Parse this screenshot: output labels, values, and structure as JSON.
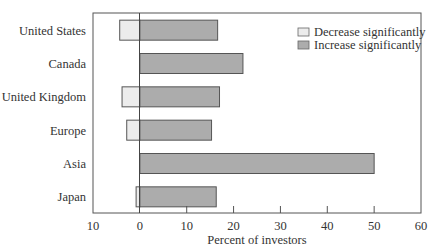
{
  "chart_data": {
    "type": "bar",
    "orientation": "horizontal",
    "stacked": "diverging",
    "title": "",
    "xlabel": "Percent of investors",
    "ylabel": "",
    "xlim": [
      -10,
      60
    ],
    "x_ticks": [
      -10,
      0,
      10,
      20,
      30,
      40,
      50,
      60
    ],
    "x_tick_labels": [
      "10",
      "0",
      "10",
      "20",
      "30",
      "40",
      "50",
      "60"
    ],
    "grid": false,
    "legend_position": "upper right (inside)",
    "categories": [
      "United States",
      "Canada",
      "United Kingdom",
      "Europe",
      "Asia",
      "Japan"
    ],
    "series": [
      {
        "name": "Decrease significantly",
        "color": "#ececec",
        "values": [
          -4.3,
          0,
          -3.8,
          -2.8,
          0,
          -0.8
        ]
      },
      {
        "name": "Increase significantly",
        "color": "#acacac",
        "values": [
          16.6,
          22.0,
          17.0,
          15.3,
          50.0,
          16.3
        ]
      }
    ]
  },
  "colors": {
    "axis": "#555555",
    "bar_edge": "#555555",
    "decrease_fill": "#ececec",
    "increase_fill": "#acacac"
  }
}
